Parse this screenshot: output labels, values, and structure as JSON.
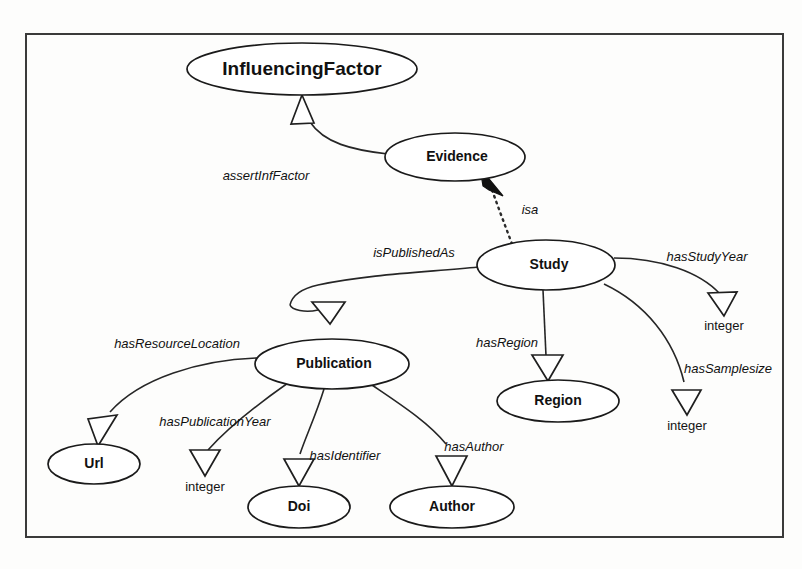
{
  "diagram": {
    "frame": {
      "x": 26,
      "y": 34,
      "width": 757,
      "height": 503
    },
    "colors": {
      "background": "#fdfdfc",
      "node_fill": "#ffffff",
      "stroke": "#1a1a1a",
      "frame_stroke": "#3a3a3a",
      "text": "#111111"
    },
    "classes": [
      {
        "id": "influencingfactor",
        "label": "InfluencingFactor",
        "cx": 302,
        "cy": 69,
        "rx": 115,
        "ry": 26,
        "font_size": 19
      },
      {
        "id": "evidence",
        "label": "Evidence",
        "cx": 455,
        "cy": 157,
        "rx": 70,
        "ry": 24,
        "font_size": 14
      },
      {
        "id": "study",
        "label": "Study",
        "cx": 546,
        "cy": 265,
        "rx": 69,
        "ry": 25,
        "font_size": 14
      },
      {
        "id": "publication",
        "label": "Publication",
        "cx": 332,
        "cy": 364,
        "rx": 77,
        "ry": 25,
        "font_size": 14
      },
      {
        "id": "region",
        "label": "Region",
        "cx": 558,
        "cy": 401,
        "rx": 61,
        "ry": 21,
        "font_size": 14
      },
      {
        "id": "url",
        "label": "Url",
        "cx": 94,
        "cy": 464,
        "rx": 46,
        "ry": 20,
        "font_size": 14
      },
      {
        "id": "doi",
        "label": "Doi",
        "cx": 299,
        "cy": 507,
        "rx": 51,
        "ry": 21,
        "font_size": 14
      },
      {
        "id": "author",
        "label": "Author",
        "cx": 452,
        "cy": 507,
        "rx": 62,
        "ry": 21,
        "font_size": 14
      }
    ],
    "datatypes": [
      {
        "id": "integer-studyyear",
        "label": "integer",
        "x": 724,
        "y": 327,
        "font_size": 13
      },
      {
        "id": "integer-samplesize",
        "label": "integer",
        "x": 687,
        "y": 427,
        "font_size": 13
      },
      {
        "id": "integer-publicationyear",
        "label": "integer",
        "x": 205,
        "y": 488,
        "font_size": 13
      }
    ],
    "relations": [
      {
        "id": "assertinffactor",
        "label": "assertInfFactor",
        "label_x": 266,
        "label_y": 177,
        "from": "evidence",
        "to": "influencingfactor",
        "arrow": "hollow-triangle",
        "style": "solid",
        "font_size": 13
      },
      {
        "id": "isa",
        "label": "isa",
        "label_x": 530,
        "label_y": 211,
        "from": "study",
        "to": "evidence",
        "arrow": "solid-triangle",
        "style": "dotted",
        "font_size": 13
      },
      {
        "id": "ispublishedas",
        "label": "isPublishedAs",
        "label_x": 414,
        "label_y": 254,
        "from": "study",
        "to": "publication",
        "arrow": "hollow-triangle",
        "style": "solid",
        "font_size": 13
      },
      {
        "id": "hasstudyyear",
        "label": "hasStudyYear",
        "label_x": 707,
        "label_y": 258,
        "from": "study",
        "to": "integer-studyyear",
        "arrow": "hollow-triangle",
        "style": "solid",
        "font_size": 13
      },
      {
        "id": "hassamplesize",
        "label": "hasSamplesize",
        "label_x": 728,
        "label_y": 370,
        "from": "study",
        "to": "integer-samplesize",
        "arrow": "hollow-triangle",
        "style": "solid",
        "font_size": 13
      },
      {
        "id": "hasregion",
        "label": "hasRegion",
        "label_x": 507,
        "label_y": 344,
        "from": "study",
        "to": "region",
        "arrow": "hollow-triangle",
        "style": "solid",
        "font_size": 13
      },
      {
        "id": "hasresourcelocation",
        "label": "hasResourceLocation",
        "label_x": 177,
        "label_y": 345,
        "from": "publication",
        "to": "url",
        "arrow": "hollow-triangle",
        "style": "solid",
        "font_size": 13
      },
      {
        "id": "haspublicationyear",
        "label": "hasPublicationYear",
        "label_x": 215,
        "label_y": 423,
        "from": "publication",
        "to": "integer-publicationyear",
        "arrow": "hollow-triangle",
        "style": "solid",
        "font_size": 13
      },
      {
        "id": "hasidentifier",
        "label": "hasIdentifier",
        "label_x": 345,
        "label_y": 457,
        "from": "publication",
        "to": "doi",
        "arrow": "hollow-triangle",
        "style": "solid",
        "font_size": 13
      },
      {
        "id": "hasauthor",
        "label": "hasAuthor",
        "label_x": 474,
        "label_y": 448,
        "from": "publication",
        "to": "author",
        "arrow": "hollow-triangle",
        "style": "solid",
        "font_size": 13
      }
    ]
  }
}
